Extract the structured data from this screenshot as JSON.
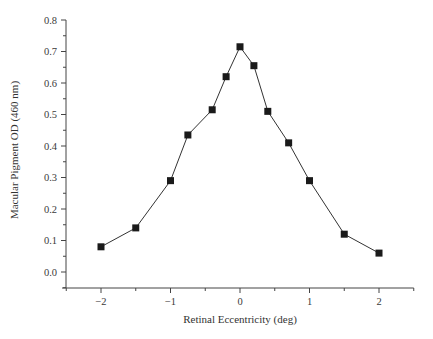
{
  "chart_data": {
    "type": "line",
    "title": "",
    "xlabel": "Retinal Eccentricity (deg)",
    "ylabel": "Macular Pigment OD (460 nm)",
    "xlim": [
      -2.5,
      2.5
    ],
    "ylim": [
      -0.055,
      0.8
    ],
    "x_ticks": [
      -2,
      -1,
      0,
      1,
      2
    ],
    "x_tick_labels": [
      "−2",
      "−1",
      "0",
      "1",
      "2"
    ],
    "x_minor_ticks": [
      -2.5,
      -1.5,
      -0.5,
      0.5,
      1.5,
      2.5
    ],
    "y_ticks": [
      0.0,
      0.1,
      0.2,
      0.3,
      0.4,
      0.5,
      0.6,
      0.7,
      0.8
    ],
    "y_tick_labels": [
      "0.0",
      "0.1",
      "0.2",
      "0.3",
      "0.4",
      "0.5",
      "0.6",
      "0.7",
      "0.8"
    ],
    "y_minor_ticks": [
      0.05,
      0.15,
      0.25,
      0.35,
      0.45,
      0.55,
      0.65,
      0.75
    ],
    "grid": false,
    "legend": null,
    "marker": "square",
    "series": [
      {
        "name": "Macular Pigment OD",
        "x": [
          -2.0,
          -1.5,
          -1.0,
          -0.75,
          -0.4,
          -0.2,
          0.0,
          0.2,
          0.4,
          0.7,
          1.0,
          1.5,
          2.0
        ],
        "values": [
          0.08,
          0.14,
          0.29,
          0.435,
          0.515,
          0.62,
          0.715,
          0.655,
          0.51,
          0.41,
          0.29,
          0.12,
          0.06
        ]
      }
    ]
  }
}
